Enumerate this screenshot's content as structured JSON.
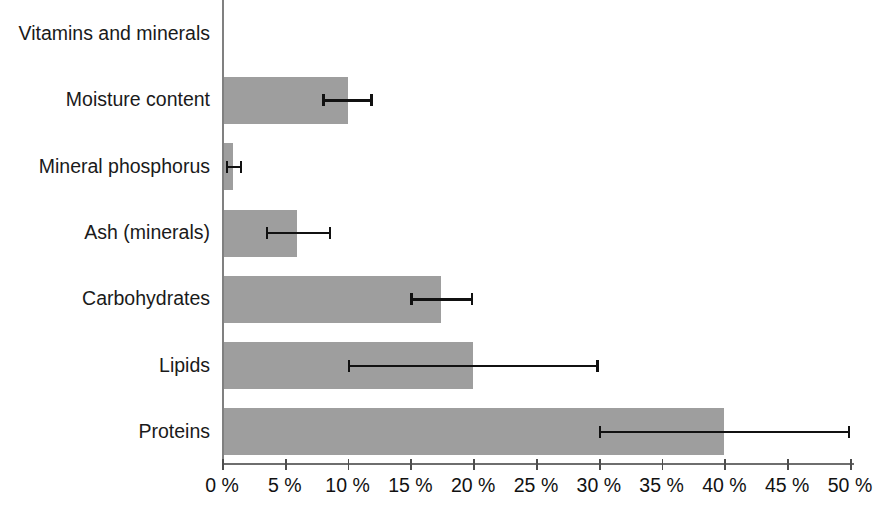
{
  "chart_data": {
    "type": "bar",
    "orientation": "horizontal",
    "title": "",
    "subtitle": "",
    "xlabel": "",
    "ylabel": "",
    "xlim": [
      0,
      52
    ],
    "grid": false,
    "legend": "none",
    "bar_color": "#9e9e9e",
    "axis_color": "#808080",
    "error_bar_color": "#111111",
    "categories": [
      "Vitamins and minerals",
      "Moisture content",
      "Mineral phosphorus",
      "Ash (minerals)",
      "Carbohydrates",
      "Lipids",
      "Proteins"
    ],
    "values": [
      0.1,
      10.0,
      0.9,
      6.0,
      17.4,
      20.0,
      40.0
    ],
    "error_low": [
      null,
      8.0,
      0.3,
      3.5,
      15.0,
      10.0,
      30.0
    ],
    "error_high": [
      null,
      12.0,
      1.6,
      8.7,
      20.0,
      30.0,
      50.0
    ],
    "xticks": [
      0,
      5,
      10,
      15,
      20,
      25,
      30,
      35,
      40,
      45,
      50
    ],
    "xtick_labels": [
      "0 %",
      "5 %",
      "10 %",
      "15 %",
      "20 %",
      "25 %",
      "30 %",
      "35 %",
      "40 %",
      "45 %",
      "50 %"
    ]
  }
}
